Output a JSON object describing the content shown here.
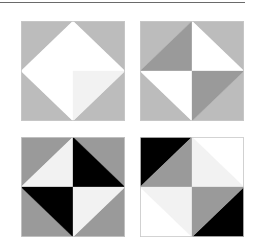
{
  "figure": {
    "colors": {
      "light_gray": "#bcbcbc",
      "mid_gray": "#9a9a9a",
      "white": "#ffffff",
      "near_white": "#f2f2f2",
      "black": "#000000",
      "border": "#c8c8c8",
      "rule": "#6a6a6a"
    },
    "tiles": [
      {
        "name": "tile-top-left",
        "description": "White diamond on light gray square",
        "quadrants": {
          "tl": {
            "outer": "light_gray",
            "inner": "white"
          },
          "tr": {
            "outer": "light_gray",
            "inner": "white"
          },
          "bl": {
            "outer": "light_gray",
            "inner": "white"
          },
          "br": {
            "outer": "light_gray",
            "inner": "near_white"
          }
        }
      },
      {
        "name": "tile-top-right",
        "description": "Pinwheel of light gray, mid gray and white triangles",
        "quadrants": {
          "tl": {
            "outer": "light_gray",
            "inner": "mid_gray"
          },
          "tr": {
            "outer": "light_gray",
            "inner": "white"
          },
          "bl": {
            "outer": "light_gray",
            "inner": "white"
          },
          "br": {
            "outer": "light_gray",
            "inner": "mid_gray"
          }
        }
      },
      {
        "name": "tile-bottom-left",
        "description": "Diamond with black and near-white triangles on mid gray",
        "quadrants": {
          "tl": {
            "outer": "mid_gray",
            "inner": "near_white"
          },
          "tr": {
            "outer": "mid_gray",
            "inner": "black"
          },
          "bl": {
            "outer": "mid_gray",
            "inner": "black"
          },
          "br": {
            "outer": "mid_gray",
            "inner": "near_white"
          }
        }
      },
      {
        "name": "tile-bottom-right",
        "description": "Black corners with mid gray and near-white triangles",
        "quadrants": {
          "tl": {
            "outer": "black",
            "inner": "mid_gray"
          },
          "tr": {
            "outer": "white",
            "inner": "near_white"
          },
          "bl": {
            "outer": "white",
            "inner": "near_white"
          },
          "br": {
            "outer": "black",
            "inner": "mid_gray"
          }
        }
      }
    ]
  }
}
